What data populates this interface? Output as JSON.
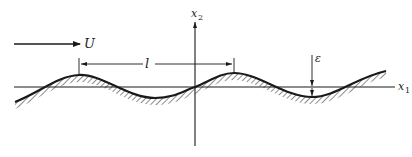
{
  "diagram": {
    "title": "",
    "flow_arrow": {
      "label": "U"
    },
    "axes": {
      "x1": {
        "label": "x",
        "subscript": "1"
      },
      "x2": {
        "label": "x",
        "subscript": "2"
      }
    },
    "wavelength": {
      "label": "l"
    },
    "amplitude": {
      "label": "ε"
    },
    "colors": {
      "ink": "#1a1a1a",
      "background": "#ffffff"
    }
  }
}
